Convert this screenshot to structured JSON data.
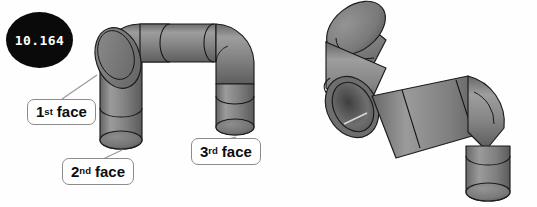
{
  "page": {
    "background_color": "#ffffff",
    "width": 537,
    "height": 207
  },
  "figures": [
    {
      "id": "figure-left",
      "badge": {
        "label": "10.164",
        "background": "#0a0a0a",
        "text_color": "#ffffff"
      },
      "subject": "three-dimensional pipe assembly with two elbow bends forming an inverted U shape",
      "pipe_color": "#7a7a7a",
      "pipe_light": "#9a9a9a",
      "pipe_dark": "#5c5c5c",
      "outline_color": "#1b1b1b",
      "callouts": [
        {
          "id": "callout-first",
          "ordinal": "1",
          "suffix": "st",
          "word": "face",
          "text": "1st face"
        },
        {
          "id": "callout-second",
          "ordinal": "2",
          "suffix": "nd",
          "word": "face",
          "text": "2nd face"
        },
        {
          "id": "callout-third",
          "ordinal": "3",
          "suffix": "rd",
          "word": "face",
          "text": "3rd face"
        }
      ]
    },
    {
      "id": "figure-right",
      "badge": {
        "label": "10.165",
        "background": "#0a0a0a",
        "text_color": "#ffffff"
      },
      "subject": "same pipe assembly rotated to show the hollow open circular end face and the S-shaped bend",
      "pipe_color": "#7a7a7a",
      "pipe_light": "#9a9a9a",
      "pipe_dark": "#5c5c5c",
      "outline_color": "#1b1b1b",
      "callouts": []
    }
  ],
  "leader_lines": {
    "color": "#999999",
    "width": 1.2,
    "count": 3
  }
}
